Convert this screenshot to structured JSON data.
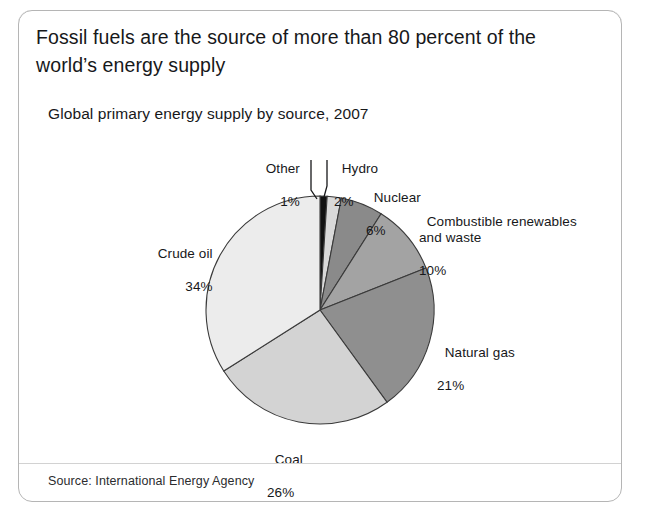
{
  "header": {
    "title": "Fossil fuels are the source of more than 80 percent of the world’s energy supply"
  },
  "chart_title": "Global primary energy supply by source, 2007",
  "source": "Source: International Energy Agency",
  "colors": {
    "header_band": "#bcbcbc",
    "card_background": "#ffffff",
    "card_border": "#b5b5b5",
    "text": "#17181a"
  },
  "labels": {
    "other": {
      "name": "Other",
      "pct": "1%"
    },
    "hydro": {
      "name": "Hydro",
      "pct": "2%"
    },
    "nuclear": {
      "name": "Nuclear",
      "pct": "6%"
    },
    "crew": {
      "name": "Combustible renewables\nand waste",
      "pct": "10%"
    },
    "natgas": {
      "name": "Natural gas",
      "pct": "21%"
    },
    "coal": {
      "name": "Coal",
      "pct": "26%"
    },
    "crude": {
      "name": "Crude oil",
      "pct": "34%"
    }
  },
  "chart_data": {
    "type": "pie",
    "title": "Global primary energy supply by source, 2007",
    "subtitle": "Fossil fuels are the source of more than 80 percent of the world’s energy supply",
    "source": "Source: International Energy Agency",
    "unit": "percent of global primary energy supply",
    "legend": "none (direct labels with leader lines)",
    "start_angle_deg": 0,
    "direction": "clockwise",
    "categories": [
      "Other",
      "Hydro",
      "Nuclear",
      "Combustible renewables and waste",
      "Natural gas",
      "Coal",
      "Crude oil"
    ],
    "values": [
      1,
      2,
      6,
      10,
      21,
      26,
      34
    ],
    "slice_colors": [
      "#111111",
      "#d9d9d9",
      "#8a8a8a",
      "#a3a3a3",
      "#8f8f8f",
      "#d3d3d3",
      "#ececec"
    ],
    "total": 100
  }
}
